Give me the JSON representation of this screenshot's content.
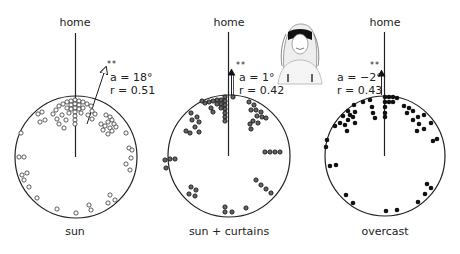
{
  "figure": {
    "panels": [
      {
        "id": "sun",
        "condition": "sun",
        "home_label": "home",
        "significance": "**",
        "stat_a": "a = 18°",
        "stat_r": "r = 0.51",
        "mean_angle_deg": 18,
        "r": 0.51,
        "marker": "open",
        "center": [
          76,
          157
        ],
        "radius": 61
      },
      {
        "id": "sun-curtains",
        "condition": "sun + curtains",
        "home_label": "home",
        "significance": "**",
        "stat_a": "a = 1°",
        "stat_r": "r = 0.42",
        "mean_angle_deg": 1,
        "r": 0.42,
        "marker": "half",
        "center": [
          229,
          156
        ],
        "radius": 61
      },
      {
        "id": "overcast",
        "condition": "overcast",
        "home_label": "home",
        "significance": "**",
        "stat_a": "a = −2°",
        "stat_r": "r = 0.43",
        "mean_angle_deg": -2,
        "r": 0.43,
        "marker": "filled",
        "center": [
          385,
          156
        ],
        "radius": 60
      }
    ],
    "illustration": "blindfolded-person-icon"
  },
  "chart_data": [
    {
      "type": "scatter",
      "subtype": "circular-orientation",
      "title": "sun",
      "reference_direction": "home (0°)",
      "mean_vector": {
        "angle_deg": 18,
        "r": 0.51,
        "significance": "**"
      }
    },
    {
      "type": "scatter",
      "subtype": "circular-orientation",
      "title": "sun + curtains",
      "reference_direction": "home (0°)",
      "mean_vector": {
        "angle_deg": 1,
        "r": 0.42,
        "significance": "**"
      }
    },
    {
      "type": "scatter",
      "subtype": "circular-orientation",
      "title": "overcast",
      "reference_direction": "home (0°)",
      "mean_vector": {
        "angle_deg": -2,
        "r": 0.43,
        "significance": "**"
      }
    }
  ]
}
